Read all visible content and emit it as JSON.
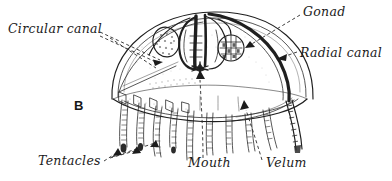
{
  "figure": {
    "panel_letter": "B",
    "background_color": "#ffffff",
    "ink_color": "#1f1f1f",
    "leader_line_style": "dashed-with-arrowhead"
  },
  "labels": [
    {
      "id": "circular-canal",
      "text": "Circular canal",
      "position": "upper-left",
      "x": 8,
      "y": 33,
      "anchor": "start"
    },
    {
      "id": "gonad",
      "text": "Gonad",
      "position": "upper-right",
      "x": 303,
      "y": 16,
      "anchor": "start"
    },
    {
      "id": "radial-canal",
      "text": "Radial canal",
      "position": "middle-right",
      "x": 300,
      "y": 57,
      "anchor": "start"
    },
    {
      "id": "tentacles",
      "text": "Tentacles",
      "position": "lower-left",
      "x": 38,
      "y": 165,
      "anchor": "start"
    },
    {
      "id": "mouth",
      "text": "Mouth",
      "position": "lower-center",
      "x": 188,
      "y": 167,
      "anchor": "start"
    },
    {
      "id": "velum",
      "text": "Velum",
      "position": "lower-right",
      "x": 266,
      "y": 167,
      "anchor": "start"
    }
  ]
}
